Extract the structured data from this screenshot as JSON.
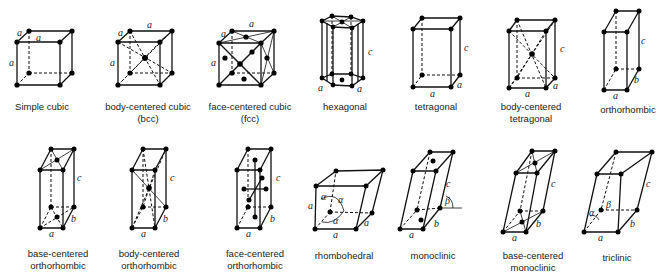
{
  "lattices": [
    {
      "id": "simple-cubic",
      "label_lines": [
        "Simple cubic"
      ],
      "axes": [
        "a",
        "a",
        "a"
      ]
    },
    {
      "id": "bcc",
      "label_lines": [
        "body-centered cubic",
        "(bcc)"
      ],
      "axes": [
        "a",
        "a",
        "a"
      ]
    },
    {
      "id": "fcc",
      "label_lines": [
        "face-centered cubic",
        "(fcc)"
      ],
      "axes": [
        "a",
        "a",
        "a"
      ]
    },
    {
      "id": "hexagonal",
      "label_lines": [
        "hexagonal"
      ],
      "axes": [
        "a",
        "a",
        "c"
      ]
    },
    {
      "id": "tetragonal",
      "label_lines": [
        "tetragonal"
      ],
      "axes": [
        "a",
        "a",
        "c"
      ]
    },
    {
      "id": "body-centered-tetragonal",
      "label_lines": [
        "body-centered",
        "tetragonal"
      ],
      "axes": [
        "a",
        "a",
        "c"
      ]
    },
    {
      "id": "orthorhombic",
      "label_lines": [
        "orthorhombic"
      ],
      "axes": [
        "a",
        "b",
        "c"
      ]
    },
    {
      "id": "base-centered-orthorhombic",
      "label_lines": [
        "base-centered",
        "orthorhombic"
      ],
      "axes": [
        "a",
        "b",
        "c"
      ]
    },
    {
      "id": "body-centered-orthorhombic",
      "label_lines": [
        "body-centered",
        "orthorhombic"
      ],
      "axes": [
        "a",
        "b",
        "c"
      ]
    },
    {
      "id": "face-centered-orthorhombic",
      "label_lines": [
        "face-centered",
        "orthorhombic"
      ],
      "axes": [
        "a",
        "b",
        "c"
      ]
    },
    {
      "id": "rhombohedral",
      "label_lines": [
        "rhombohedral"
      ],
      "axes": [
        "a",
        "a",
        "a"
      ],
      "angles": [
        "α",
        "α",
        "α"
      ]
    },
    {
      "id": "monoclinic",
      "label_lines": [
        "monoclinic"
      ],
      "axes": [
        "a",
        "b",
        "c"
      ],
      "angles": [
        "β"
      ]
    },
    {
      "id": "base-centered-monoclinic",
      "label_lines": [
        "base-centered",
        "monoclinic"
      ],
      "axes": [
        "a",
        "b",
        "c"
      ]
    },
    {
      "id": "triclinic",
      "label_lines": [
        "triclinic"
      ],
      "axes": [
        "a",
        "b",
        "c"
      ],
      "angles": [
        "α",
        "β"
      ]
    }
  ]
}
